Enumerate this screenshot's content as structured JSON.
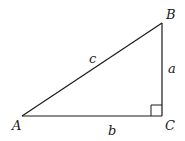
{
  "diagram": {
    "type": "right-triangle",
    "vertices": {
      "A": {
        "label": "A",
        "x": 22,
        "y": 116
      },
      "B": {
        "label": "B",
        "x": 162,
        "y": 23
      },
      "C": {
        "label": "C",
        "x": 162,
        "y": 116
      }
    },
    "sides": {
      "a": {
        "label": "a",
        "between": [
          "B",
          "C"
        ]
      },
      "b": {
        "label": "b",
        "between": [
          "A",
          "C"
        ]
      },
      "c": {
        "label": "c",
        "between": [
          "A",
          "B"
        ]
      }
    },
    "right_angle_at": "C",
    "stroke_color": "#1a1a1a",
    "background": "#ffffff"
  }
}
